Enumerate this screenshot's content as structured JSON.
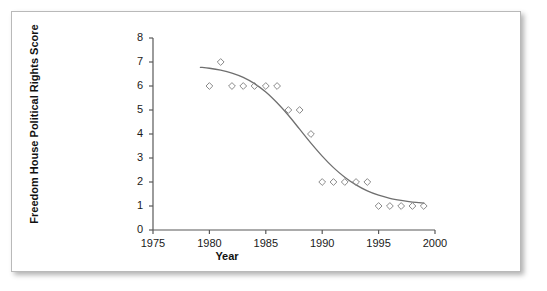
{
  "figure": {
    "background_color": "#ffffff",
    "border_color": "#b9b9b9",
    "axis_color": "#595959",
    "marker_color": "#8a8a8a",
    "curve_color": "#6f6f6f"
  },
  "chart_data": {
    "type": "scatter",
    "title": "",
    "xlabel": "Year",
    "ylabel": "Freedom House Political Rights Score",
    "xlim": [
      1975,
      2000
    ],
    "ylim": [
      0,
      8
    ],
    "xticks": [
      1975,
      1980,
      1985,
      1990,
      1995,
      2000
    ],
    "xtick_labels": [
      "1975",
      "1980",
      "1985",
      "1990",
      "1995",
      "2000"
    ],
    "yticks": [
      0,
      1,
      2,
      3,
      4,
      5,
      6,
      7,
      8
    ],
    "ytick_labels": [
      "0",
      "1",
      "2",
      "3",
      "4",
      "5",
      "6",
      "7",
      "8"
    ],
    "grid": false,
    "legend": false,
    "marker": "open-diamond",
    "series": [
      {
        "name": "Freedom House Political Rights Score",
        "x": [
          1980,
          1981,
          1982,
          1983,
          1984,
          1985,
          1986,
          1987,
          1988,
          1989,
          1990,
          1991,
          1992,
          1993,
          1994,
          1995,
          1996,
          1997,
          1998,
          1999
        ],
        "values": [
          6,
          7,
          6,
          6,
          6,
          6,
          6,
          5,
          5,
          4,
          2,
          2,
          2,
          2,
          2,
          1,
          1,
          1,
          1,
          1
        ]
      }
    ],
    "trend_curve": {
      "name": "fitted logistic trend",
      "x": [
        1979.2,
        1980.0,
        1981.0,
        1982.0,
        1983.0,
        1984.0,
        1985.0,
        1986.0,
        1987.0,
        1988.0,
        1989.0,
        1990.0,
        1991.0,
        1992.0,
        1993.0,
        1994.0,
        1995.0,
        1996.0,
        1997.0,
        1998.0,
        1999.0
      ],
      "y": [
        6.78,
        6.74,
        6.66,
        6.54,
        6.36,
        6.1,
        5.75,
        5.3,
        4.78,
        4.2,
        3.62,
        3.08,
        2.6,
        2.2,
        1.88,
        1.63,
        1.45,
        1.32,
        1.23,
        1.16,
        1.12
      ]
    }
  }
}
